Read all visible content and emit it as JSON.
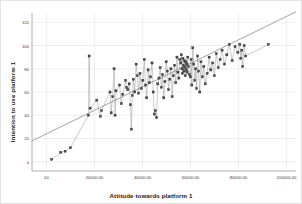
{
  "chart_data": {
    "type": "scatter",
    "title": "",
    "xlabel": "Attitude towards platform 1",
    "ylabel": "Intention to use platform 1",
    "xlim": [
      -6000,
      104000
    ],
    "ylim": [
      -8,
      128
    ],
    "xticks": [
      "00",
      "20000,00",
      "40000,00",
      "60000,00",
      "80000,00",
      "100000,00"
    ],
    "xtick_values": [
      0,
      20000,
      40000,
      60000,
      80000,
      100000
    ],
    "yticks": [
      "0",
      "20",
      "40",
      "60",
      "80",
      "100",
      "120"
    ],
    "ytick_values": [
      0,
      20,
      40,
      60,
      80,
      100,
      120
    ],
    "grid": true,
    "grid_color": "#d7dde6",
    "legend": "none",
    "marker": {
      "shape": "square",
      "size": 2.2,
      "color": "#4a4a4a",
      "edge_color": "#2b2b2b"
    },
    "connector_line": {
      "color": "#8a8a8a",
      "width": 0.45,
      "style": "solid"
    },
    "fit_line": {
      "color": "#5a5a5a",
      "width": 0.55,
      "intercept": 24,
      "slope_per_unit": 0.00101
    },
    "points": [
      [
        2200,
        2
      ],
      [
        6000,
        8
      ],
      [
        7800,
        9
      ],
      [
        10000,
        12
      ],
      [
        17500,
        40
      ],
      [
        17800,
        91
      ],
      [
        18200,
        46
      ],
      [
        21000,
        53
      ],
      [
        22500,
        39
      ],
      [
        23000,
        44
      ],
      [
        26500,
        60
      ],
      [
        27000,
        42
      ],
      [
        27600,
        56
      ],
      [
        28200,
        80
      ],
      [
        28600,
        40
      ],
      [
        29000,
        61
      ],
      [
        30500,
        66
      ],
      [
        31200,
        50
      ],
      [
        31800,
        58
      ],
      [
        33000,
        70
      ],
      [
        33400,
        64
      ],
      [
        33900,
        62
      ],
      [
        34500,
        67
      ],
      [
        35000,
        49
      ],
      [
        35400,
        28
      ],
      [
        35800,
        57
      ],
      [
        36200,
        71
      ],
      [
        36800,
        60
      ],
      [
        37400,
        84
      ],
      [
        37900,
        74
      ],
      [
        38400,
        59
      ],
      [
        39000,
        76
      ],
      [
        39600,
        63
      ],
      [
        40200,
        70
      ],
      [
        40800,
        88
      ],
      [
        41300,
        66
      ],
      [
        41800,
        55
      ],
      [
        42400,
        79
      ],
      [
        42900,
        68
      ],
      [
        43400,
        73
      ],
      [
        44000,
        85
      ],
      [
        44500,
        60
      ],
      [
        45000,
        41
      ],
      [
        45400,
        44
      ],
      [
        45900,
        38
      ],
      [
        46400,
        67
      ],
      [
        46900,
        72
      ],
      [
        47400,
        81
      ],
      [
        47900,
        64
      ],
      [
        48400,
        75
      ],
      [
        48900,
        55
      ],
      [
        49400,
        69
      ],
      [
        49900,
        86
      ],
      [
        50400,
        78
      ],
      [
        50900,
        62
      ],
      [
        51400,
        71
      ],
      [
        51900,
        80
      ],
      [
        52400,
        56
      ],
      [
        52900,
        74
      ],
      [
        53400,
        83
      ],
      [
        53900,
        68
      ],
      [
        54400,
        90
      ],
      [
        54800,
        77
      ],
      [
        55200,
        72
      ],
      [
        55600,
        88
      ],
      [
        56000,
        85
      ],
      [
        56200,
        92
      ],
      [
        56500,
        80
      ],
      [
        56700,
        76
      ],
      [
        56900,
        89
      ],
      [
        57100,
        83
      ],
      [
        57300,
        78
      ],
      [
        57500,
        87
      ],
      [
        57700,
        81
      ],
      [
        57900,
        74
      ],
      [
        58100,
        86
      ],
      [
        58300,
        79
      ],
      [
        58500,
        84
      ],
      [
        58700,
        77
      ],
      [
        58900,
        90
      ],
      [
        59200,
        82
      ],
      [
        59600,
        75
      ],
      [
        60000,
        73
      ],
      [
        60300,
        88
      ],
      [
        60600,
        66
      ],
      [
        61000,
        98
      ],
      [
        61400,
        84
      ],
      [
        61800,
        70
      ],
      [
        62200,
        80
      ],
      [
        62600,
        63
      ],
      [
        63000,
        91
      ],
      [
        63400,
        78
      ],
      [
        63900,
        60
      ],
      [
        64400,
        86
      ],
      [
        65000,
        73
      ],
      [
        65600,
        82
      ],
      [
        66200,
        67
      ],
      [
        67000,
        76
      ],
      [
        67800,
        90
      ],
      [
        68500,
        79
      ],
      [
        69300,
        85
      ],
      [
        70000,
        74
      ],
      [
        70800,
        93
      ],
      [
        71600,
        81
      ],
      [
        72400,
        88
      ],
      [
        73200,
        96
      ],
      [
        74200,
        84
      ],
      [
        75200,
        92
      ],
      [
        76200,
        101
      ],
      [
        77400,
        87
      ],
      [
        78600,
        99
      ],
      [
        79800,
        94
      ],
      [
        80600,
        101
      ],
      [
        81000,
        89
      ],
      [
        81400,
        96
      ],
      [
        81800,
        82
      ],
      [
        82400,
        100
      ],
      [
        83000,
        91
      ],
      [
        92500,
        101
      ]
    ]
  }
}
